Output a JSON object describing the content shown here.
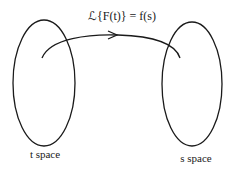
{
  "diagram": {
    "formula": "ℒ{F(t)} = f(s)",
    "left_space_label": "t space",
    "right_space_label": "s space",
    "stroke_color": "#1a1a1a"
  }
}
